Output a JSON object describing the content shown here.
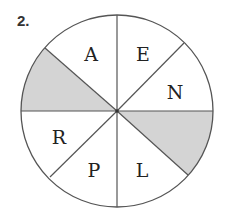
{
  "problem": {
    "number": "2."
  },
  "diagram": {
    "center": [
      117,
      111
    ],
    "radius": 96,
    "stroke_color": "#555555",
    "shade_color": "#d4d4d4",
    "spokes": [
      {
        "name": "top",
        "end": [
          117,
          17
        ]
      },
      {
        "name": "bottom",
        "end": [
          117,
          205
        ]
      },
      {
        "name": "left",
        "end": [
          21,
          111
        ]
      },
      {
        "name": "right",
        "end": [
          213,
          111
        ]
      },
      {
        "name": "upper-left",
        "end": [
          45,
          48
        ]
      },
      {
        "name": "upper-right",
        "end": [
          184,
          43
        ]
      },
      {
        "name": "lower-right",
        "end": [
          188,
          175
        ]
      },
      {
        "name": "lower-left",
        "end": [
          50,
          177
        ]
      }
    ],
    "sectors": [
      {
        "label": "A",
        "x": 91,
        "y": 61,
        "shaded": false
      },
      {
        "label": "E",
        "x": 143,
        "y": 61,
        "shaded": false
      },
      {
        "label": "N",
        "x": 175,
        "y": 99,
        "shaded": false
      },
      {
        "label": "",
        "shaded": true,
        "position": "right-lower"
      },
      {
        "label": "L",
        "x": 142,
        "y": 177,
        "shaded": false
      },
      {
        "label": "P",
        "x": 94,
        "y": 177,
        "shaded": false
      },
      {
        "label": "R",
        "x": 59,
        "y": 144,
        "shaded": false
      },
      {
        "label": "",
        "shaded": true,
        "position": "left-upper"
      }
    ],
    "labels": {
      "a": "A",
      "e": "E",
      "n": "N",
      "l": "L",
      "p": "P",
      "r": "R"
    }
  }
}
